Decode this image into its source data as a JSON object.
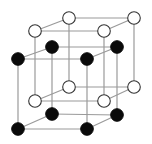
{
  "diagram": {
    "type": "crystal-lattice",
    "colors": {
      "background": "#ffffff",
      "edge": "#9a9a9a",
      "white_atom_fill": "#ffffff",
      "white_atom_stroke": "#333333",
      "black_atom_fill": "#0a0a0a"
    },
    "atom_radius": 6.3,
    "sublattices": [
      {
        "name": "white-sublattice",
        "atom_style": "white",
        "vertices": [
          [
            35,
            31
          ],
          [
            104,
            31
          ],
          [
            104,
            101
          ],
          [
            35,
            101
          ],
          [
            69,
            18
          ],
          [
            134,
            18
          ],
          [
            134,
            87
          ],
          [
            69,
            87
          ]
        ]
      },
      {
        "name": "black-sublattice",
        "atom_style": "black",
        "vertices": [
          [
            18,
            59
          ],
          [
            87,
            59
          ],
          [
            87,
            129
          ],
          [
            18,
            129
          ],
          [
            52,
            47
          ],
          [
            117,
            47
          ],
          [
            117,
            115
          ],
          [
            52,
            114
          ]
        ]
      }
    ],
    "cube_edges": [
      [
        0,
        1
      ],
      [
        1,
        2
      ],
      [
        2,
        3
      ],
      [
        3,
        0
      ],
      [
        4,
        5
      ],
      [
        5,
        6
      ],
      [
        6,
        7
      ],
      [
        7,
        4
      ],
      [
        0,
        4
      ],
      [
        1,
        5
      ],
      [
        2,
        6
      ],
      [
        3,
        7
      ]
    ]
  }
}
